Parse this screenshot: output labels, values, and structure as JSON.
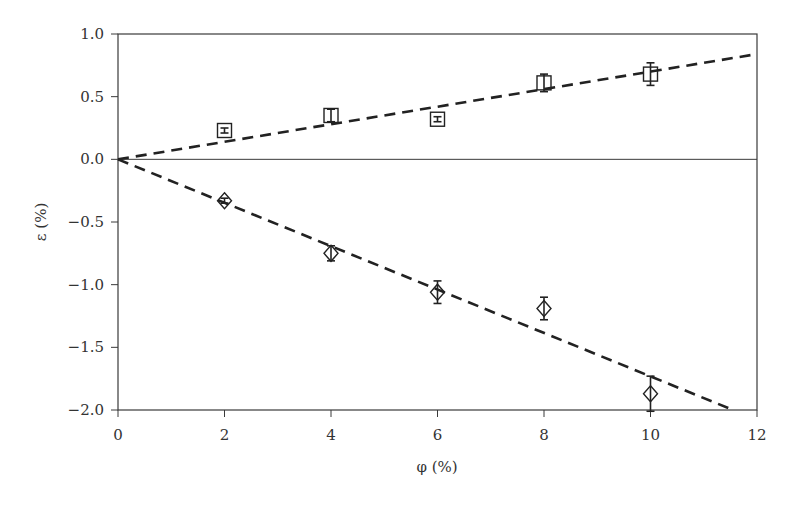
{
  "chart_data": {
    "type": "scatter",
    "title": "",
    "xlabel": "φ (%)",
    "ylabel": "ε (%)",
    "xlim": [
      0,
      12
    ],
    "ylim": [
      -2.0,
      1.0
    ],
    "x_ticks": [
      "0",
      "2",
      "4",
      "6",
      "8",
      "10",
      "12"
    ],
    "y_ticks": [
      "1.0",
      "0.5",
      "0.0",
      "−0.5",
      "−1.0",
      "−1.5",
      "−2.0"
    ],
    "grid": false,
    "legend": null,
    "zero_line": true,
    "series": [
      {
        "name": "squares",
        "marker": "square",
        "x": [
          2,
          4,
          6,
          8,
          10
        ],
        "y": [
          0.23,
          0.35,
          0.32,
          0.61,
          0.68
        ],
        "yerr": [
          0.02,
          0.05,
          0.02,
          0.07,
          0.09
        ]
      },
      {
        "name": "diamonds",
        "marker": "diamond",
        "x": [
          2,
          4,
          6,
          8,
          10
        ],
        "y": [
          -0.33,
          -0.75,
          -1.06,
          -1.19,
          -1.87
        ],
        "yerr": [
          0.02,
          0.06,
          0.09,
          0.09,
          0.14
        ]
      }
    ],
    "fit_lines": [
      {
        "name": "upper-fit",
        "style": "dashed",
        "x": [
          0,
          12
        ],
        "y": [
          0,
          0.84
        ]
      },
      {
        "name": "lower-fit",
        "style": "dashed",
        "x": [
          0,
          11.55
        ],
        "y": [
          0,
          -2.0
        ]
      }
    ]
  }
}
